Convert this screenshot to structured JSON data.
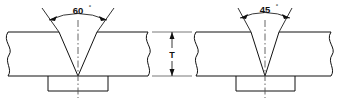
{
  "drawing": {
    "title": "V-Groove Weld Joint Cross Sections",
    "stroke_color": "#111111",
    "centerline_color": "#555555",
    "background_color": "#ffffff",
    "joints": [
      {
        "id": "left-joint",
        "groove_angle_value": "60",
        "degree_symbol": "°",
        "groove_angle_label": "60°",
        "centerline_name": "joint-centerline",
        "backing_bar_name": "backing-bar",
        "break_line_left": "break-line",
        "break_line_right": "break-line"
      },
      {
        "id": "right-joint",
        "groove_angle_value": "45",
        "degree_symbol": "°",
        "groove_angle_label": "45°",
        "centerline_name": "joint-centerline",
        "backing_bar_name": "backing-bar",
        "break_line_left": "break-line",
        "break_line_right": "break-line"
      }
    ],
    "thickness_dimension": {
      "label": "T",
      "name": "plate-thickness-dimension",
      "description": "plate thickness"
    }
  }
}
